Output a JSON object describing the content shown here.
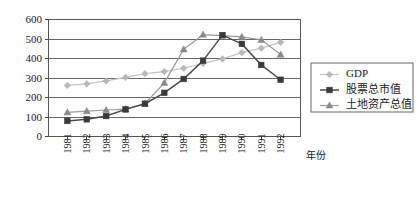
{
  "chart_data": {
    "type": "line",
    "title": "",
    "xlabel": "年份",
    "ylabel": "",
    "categories": [
      "1981",
      "1982",
      "1983",
      "1984",
      "1985",
      "1986",
      "1987",
      "1988",
      "1989",
      "1990",
      "1991",
      "1992"
    ],
    "ylim": [
      0,
      600
    ],
    "xlim_categories": [
      "1981",
      "1992"
    ],
    "ytick_labels": [
      "0",
      "100",
      "200",
      "300",
      "400",
      "500",
      "600"
    ],
    "ytick_values": [
      0,
      100,
      200,
      300,
      400,
      500,
      600
    ],
    "grid": true,
    "grid_axis": "y",
    "legend_position": "right",
    "series": [
      {
        "name": "GDP",
        "marker": "diamond",
        "color": "#b8b8b8",
        "line_color": "#c4c4c4",
        "values": [
          262,
          270,
          285,
          303,
          322,
          333,
          350,
          375,
          398,
          430,
          453,
          483
        ]
      },
      {
        "name": "股票总市值",
        "marker": "square",
        "color": "#3a3a3a",
        "line_color": "#4a4a4a",
        "values": [
          80,
          88,
          105,
          139,
          168,
          224,
          295,
          389,
          520,
          475,
          367,
          291
        ]
      },
      {
        "name": "土地资产总值",
        "marker": "triangle",
        "color": "#8a8a8a",
        "line_color": "#9a9a9a",
        "values": [
          124,
          130,
          136,
          140,
          168,
          275,
          447,
          522,
          517,
          511,
          496,
          420
        ]
      }
    ]
  },
  "legend": {
    "entries": [
      {
        "label": "GDP"
      },
      {
        "label": "股票总市值"
      },
      {
        "label": "土地资产总值"
      }
    ]
  },
  "axes": {
    "x_axis_title": "年份"
  },
  "colors": {
    "gdp": "#b8b8b8",
    "stock": "#3a3a3a",
    "land": "#8a8a8a",
    "grid": "#555555",
    "frame": "#555555",
    "text": "#1a1a1a",
    "background": "#ffffff"
  }
}
